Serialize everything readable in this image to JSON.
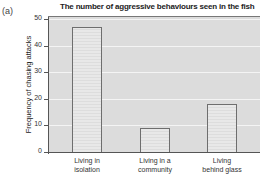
{
  "panel_label": "(a)",
  "chart_data": {
    "type": "bar",
    "title": "The number of aggressive behaviours seen in the fish",
    "xlabel": "",
    "ylabel": "Frequency of chasing attacks",
    "categories": [
      "Living in isolation",
      "Living in a community",
      "Living behind glass"
    ],
    "category_lines": [
      [
        "Living in",
        "isolation"
      ],
      [
        "Living in a",
        "community"
      ],
      [
        "Living",
        "behind glass"
      ]
    ],
    "values": [
      47,
      9,
      18
    ],
    "ylim": [
      0,
      50
    ],
    "yticks": [
      0,
      10,
      20,
      30,
      40,
      50
    ],
    "grid": true,
    "legend": null
  },
  "colors": {
    "plot_background": "#dcdcdc",
    "bar_fill": "#e6e6e6",
    "bar_edge": "#6e6e6e",
    "gridline": "#f4f4f4"
  }
}
